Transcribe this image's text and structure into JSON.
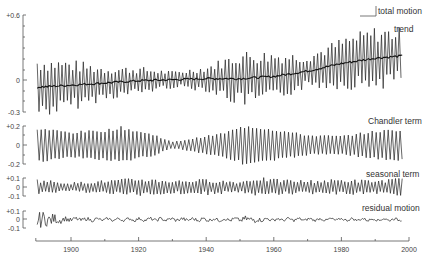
{
  "chart_data": {
    "type": "line",
    "title": "",
    "xlabel": "",
    "x_axis": {
      "range": [
        1889.6,
        2000
      ],
      "ticks": [
        1900,
        1920,
        1940,
        1960,
        1980,
        2000
      ],
      "tick_labels": [
        "1900",
        "1920",
        "1940",
        "1960",
        "1980",
        "2000"
      ],
      "minor_ticks": [
        1910,
        1930,
        1950,
        1970,
        1990
      ],
      "data_range": [
        1890,
        1998
      ]
    },
    "panels": [
      {
        "name": "total motion",
        "labels": [
          "total motion",
          "trend"
        ],
        "y_ticks": [
          "+0.6",
          "0",
          "-0.3"
        ],
        "ylim": [
          -0.3,
          0.6
        ],
        "series": [
          {
            "name": "total motion",
            "kind": "oscillation",
            "envelope_years": [
              1890,
              1900,
              1910,
              1920,
              1930,
              1940,
              1950,
              1960,
              1970,
              1980,
              1990,
              1998
            ],
            "amplitude": [
              0.22,
              0.18,
              0.12,
              0.1,
              0.06,
              0.09,
              0.2,
              0.18,
              0.12,
              0.18,
              0.22,
              0.2
            ]
          },
          {
            "name": "trend",
            "kind": "line",
            "x": [
              1890,
              1900,
              1910,
              1920,
              1930,
              1940,
              1950,
              1960,
              1970,
              1980,
              1990,
              1998
            ],
            "values": [
              -0.07,
              -0.05,
              -0.03,
              -0.01,
              0.0,
              0.01,
              0.01,
              0.03,
              0.08,
              0.15,
              0.2,
              0.22
            ]
          }
        ]
      },
      {
        "name": "Chandler term",
        "labels": [
          "Chandler term"
        ],
        "y_ticks": [
          "+0.2",
          "0",
          "-0.2"
        ],
        "ylim": [
          -0.2,
          0.2
        ],
        "series": [
          {
            "name": "Chandler term",
            "kind": "oscillation",
            "envelope_years": [
              1890,
              1900,
              1910,
              1915,
              1925,
              1930,
              1935,
              1945,
              1952,
              1960,
              1970,
              1980,
              1990,
              1998
            ],
            "amplitude": [
              0.17,
              0.13,
              0.15,
              0.18,
              0.1,
              0.03,
              0.06,
              0.12,
              0.2,
              0.16,
              0.1,
              0.09,
              0.14,
              0.16
            ]
          }
        ]
      },
      {
        "name": "seasonal term",
        "labels": [
          "seasonal term"
        ],
        "y_ticks": [
          "+0.1",
          "0",
          "-0.1"
        ],
        "ylim": [
          -0.1,
          0.1
        ],
        "series": [
          {
            "name": "seasonal term",
            "kind": "oscillation",
            "envelope_years": [
              1890,
              1900,
              1910,
              1920,
              1930,
              1940,
              1950,
              1955,
              1960,
              1970,
              1980,
              1990,
              1998
            ],
            "amplitude": [
              0.07,
              0.04,
              0.06,
              0.08,
              0.06,
              0.07,
              0.05,
              0.09,
              0.07,
              0.06,
              0.07,
              0.06,
              0.08
            ]
          }
        ]
      },
      {
        "name": "residual motion",
        "labels": [
          "residual motion"
        ],
        "y_ticks": [
          "+0.1",
          "0",
          "-0.1"
        ],
        "ylim": [
          -0.1,
          0.1
        ],
        "series": [
          {
            "name": "residual motion",
            "kind": "noise",
            "envelope_years": [
              1890,
              1893,
              1898,
              1910,
              1930,
              1950,
              1954,
              1956,
              1970,
              1998
            ],
            "amplitude": [
              0.1,
              0.08,
              0.03,
              0.015,
              0.02,
              0.02,
              0.06,
              0.02,
              0.015,
              0.015
            ]
          }
        ]
      }
    ]
  }
}
